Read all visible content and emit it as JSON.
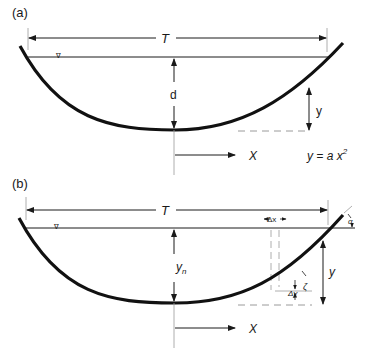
{
  "figure": {
    "panels": [
      {
        "id": "a",
        "label": "(a)",
        "top_width_label": "T",
        "depth_label": "d",
        "height_label": "y",
        "axis_label": "X",
        "equation": "y = a x",
        "equation_exponent": "2",
        "water_surface_symbol": "∇"
      },
      {
        "id": "b",
        "label": "(b)",
        "top_width_label": "T",
        "depth_label": "y",
        "depth_subscript": "n",
        "height_label": "y",
        "axis_label": "X",
        "dx_label": "Δx",
        "dy_label": "Δy",
        "angle_zeta": "ζ",
        "angle_alpha": "α",
        "water_surface_symbol": "∇"
      }
    ]
  },
  "colors": {
    "line": "#1a1a1a",
    "dashed": "#9a9a9a",
    "background": "#ffffff"
  }
}
